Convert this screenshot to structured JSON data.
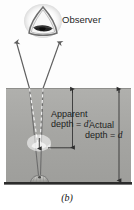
{
  "figure": {
    "caption": "(b)",
    "observer_label": "Observer",
    "apparent_line1": "Apparent",
    "apparent_line2_prefix": "depth = ",
    "apparent_symbol": "d′",
    "actual_line1": "Actual",
    "actual_line2_prefix": "depth = ",
    "actual_symbol": "d",
    "icons": {
      "eye": "eye-icon",
      "fish_real": "fish-icon",
      "fish_apparent": "apparent-fish-icon",
      "ray_arrow": "arrow-up-icon",
      "dimension_arrow": "dimension-arrow-icon"
    },
    "colors": {
      "medium_fill": "#a9a9a6",
      "medium_top": "#b0b0ad",
      "medium_bottom": "#9e9e9b",
      "ray_stroke": "#5a5a5a",
      "dashed_stroke": "#f2f2f2",
      "floor_line": "#2b2b2b",
      "text": "#1d1d1d",
      "background": "#ffffff"
    },
    "geometry": {
      "surface_y": 88,
      "floor_y": 183,
      "apparent_depth_y": 148,
      "actual_depth_y": 178,
      "medium_left": 6,
      "medium_right": 131
    }
  }
}
